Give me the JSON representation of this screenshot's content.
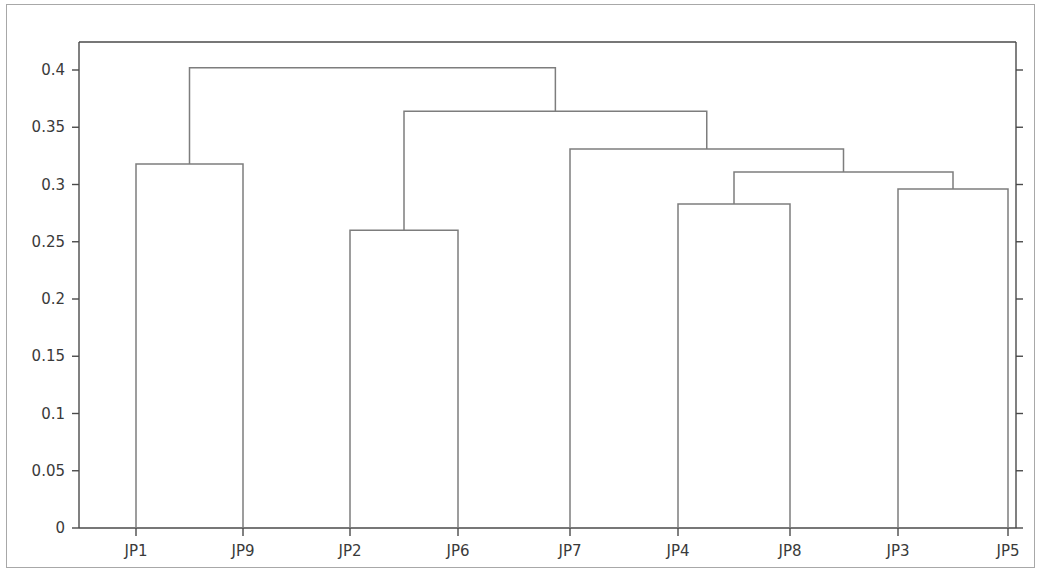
{
  "chart_data": {
    "type": "line",
    "subtype": "dendrogram",
    "title": "",
    "subtitle": "",
    "xlabel": "",
    "ylabel": "",
    "grid": false,
    "legend": null,
    "orientation": "vertical",
    "ylim": [
      0,
      0.42
    ],
    "yticks": [
      0,
      0.05,
      0.1,
      0.15,
      0.2,
      0.25,
      0.3,
      0.35,
      0.4
    ],
    "ytick_labels": [
      "0",
      "0.05",
      "0.1",
      "0.15",
      "0.2",
      "0.25",
      "0.3",
      "0.35",
      "0.4"
    ],
    "leaf_labels": [
      "JP1",
      "JP9",
      "JP2",
      "JP6",
      "JP7",
      "JP4",
      "JP8",
      "JP3",
      "JP5"
    ],
    "xtick_labels": [
      "JP1",
      "JP9",
      "JP2",
      "JP6",
      "JP7",
      "JP4",
      "JP8",
      "JP3",
      "JP5"
    ],
    "leaf_positions": [
      136,
      243,
      350,
      458,
      570,
      678,
      790,
      898,
      1008
    ],
    "line_color": "#7d7d7d",
    "axis_color": "#4a4a4a",
    "text_color": "#3a3a3a",
    "background_color": "#ffffff",
    "merges": [
      {
        "name": "JP1-JP9",
        "left": "JP1",
        "right": "JP9",
        "height": 0.318
      },
      {
        "name": "JP2-JP6",
        "left": "JP2",
        "right": "JP6",
        "height": 0.26
      },
      {
        "name": "JP4-JP8",
        "left": "JP4",
        "right": "JP8",
        "height": 0.283
      },
      {
        "name": "JP3-JP5",
        "left": "JP3",
        "right": "JP5",
        "height": 0.296
      },
      {
        "name": "JP4JP8-JP3JP5",
        "left": "JP4-JP8",
        "right": "JP3-JP5",
        "height": 0.311
      },
      {
        "name": "JP7-cluster",
        "left": "JP7",
        "right": "JP4JP8-JP3JP5",
        "height": 0.331
      },
      {
        "name": "JP2JP6-JP7cluster",
        "left": "JP2-JP6",
        "right": "JP7-cluster",
        "height": 0.364
      },
      {
        "name": "root",
        "left": "JP1-JP9",
        "right": "JP2JP6-JP7cluster",
        "height": 0.402
      }
    ],
    "merge_heights": [
      0.318,
      0.26,
      0.283,
      0.296,
      0.311,
      0.331,
      0.364,
      0.402
    ]
  }
}
